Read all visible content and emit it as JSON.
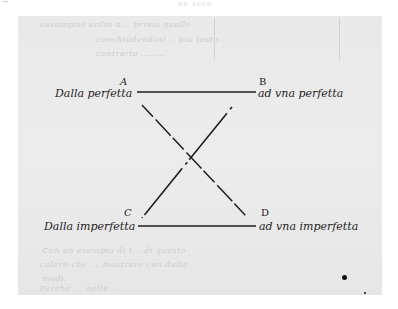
{
  "header": {
    "running_text": "un seco"
  },
  "page": {
    "faded_text_top": [
      "assumptio ordin a... primo quello",
      "conchiudendosi... piu tosto...",
      "contrario    ........"
    ],
    "faded_text_bottom": [
      "Con un esempio di i...  di questo",
      "coloro che ... mostrare con dalla",
      "modi.",
      "Perche ... nelle ... "
    ]
  },
  "diagram": {
    "points": {
      "A": "A",
      "B": "B",
      "C": "C",
      "D": "D"
    },
    "labels": {
      "top_left": "Dalla perfetta",
      "top_right": "ad vna perfetta",
      "bottom_left": "Dalla imperfetta",
      "bottom_right": "ad vna imperfetta"
    },
    "lines": [
      {
        "from": "A",
        "to": "B",
        "style": "solid"
      },
      {
        "from": "C",
        "to": "D",
        "style": "solid"
      },
      {
        "from": "A",
        "to": "D",
        "style": "dashed"
      },
      {
        "from": "B",
        "to": "C",
        "style": "dashed"
      }
    ],
    "ink_color": "#1e1e1e",
    "paper_color": "#e9e9e9"
  }
}
